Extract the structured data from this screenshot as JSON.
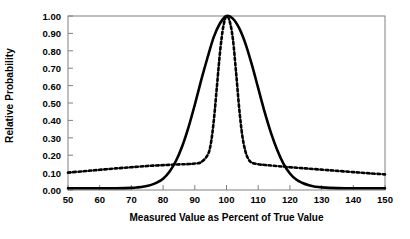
{
  "chart_data": {
    "type": "line",
    "title": "",
    "xlabel": "Measured Value as Percent of True Value",
    "ylabel": "Relative Probability",
    "xlim": [
      50,
      150
    ],
    "ylim": [
      0.0,
      1.0
    ],
    "grid": false,
    "legend": "none",
    "x_ticks": [
      50,
      60,
      70,
      80,
      90,
      100,
      110,
      120,
      130,
      140,
      150
    ],
    "x_tick_labels": [
      "50",
      "60",
      "70",
      "80",
      "90",
      "100",
      "110",
      "120",
      "130",
      "140",
      "150"
    ],
    "y_ticks": [
      0.0,
      0.1,
      0.2,
      0.3,
      0.4,
      0.5,
      0.6,
      0.7,
      0.8,
      0.9,
      1.0
    ],
    "y_tick_labels": [
      "0.00",
      "0.10",
      "0.20",
      "0.30",
      "0.40",
      "0.50",
      "0.60",
      "0.70",
      "0.80",
      "0.90",
      "1.00"
    ],
    "series": [
      {
        "name": "broad-distribution",
        "style": "solid",
        "color": "#000000",
        "linewidth": 2.6,
        "x": [
          50,
          55,
          60,
          65,
          70,
          72,
          74,
          76,
          78,
          80,
          82,
          84,
          86,
          88,
          90,
          92,
          94,
          96,
          98,
          100,
          102,
          104,
          106,
          108,
          110,
          112,
          114,
          116,
          118,
          120,
          122,
          124,
          126,
          128,
          130,
          135,
          140,
          145,
          150
        ],
        "y": [
          0.01,
          0.01,
          0.01,
          0.01,
          0.012,
          0.015,
          0.02,
          0.028,
          0.042,
          0.065,
          0.105,
          0.165,
          0.25,
          0.36,
          0.49,
          0.63,
          0.76,
          0.88,
          0.96,
          1.0,
          0.985,
          0.93,
          0.84,
          0.72,
          0.585,
          0.45,
          0.33,
          0.23,
          0.15,
          0.095,
          0.06,
          0.04,
          0.027,
          0.019,
          0.015,
          0.011,
          0.01,
          0.01,
          0.01
        ]
      },
      {
        "name": "narrow-distribution",
        "style": "dashed",
        "color": "#000000",
        "linewidth": 2.6,
        "x": [
          50,
          55,
          60,
          65,
          70,
          75,
          80,
          85,
          88,
          90,
          92,
          94,
          95,
          96,
          97,
          98,
          99,
          100,
          101,
          102,
          103,
          104,
          105,
          106,
          107,
          108,
          110,
          112,
          115,
          120,
          125,
          130,
          135,
          140,
          145,
          150
        ],
        "y": [
          0.1,
          0.108,
          0.116,
          0.124,
          0.131,
          0.138,
          0.143,
          0.147,
          0.149,
          0.152,
          0.16,
          0.2,
          0.26,
          0.4,
          0.6,
          0.8,
          0.94,
          1.0,
          0.97,
          0.87,
          0.68,
          0.47,
          0.31,
          0.22,
          0.175,
          0.157,
          0.148,
          0.144,
          0.139,
          0.131,
          0.124,
          0.117,
          0.11,
          0.103,
          0.096,
          0.09
        ]
      }
    ]
  },
  "axes": {
    "frame_color": "#808080",
    "tick_color": "#808080",
    "background": "#ffffff"
  }
}
